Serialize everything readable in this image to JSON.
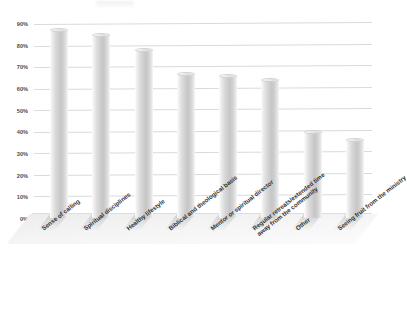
{
  "chart_data": {
    "type": "bar",
    "title": "",
    "subtitle": "",
    "xlabel": "",
    "ylabel": "",
    "ylim": [
      0,
      90
    ],
    "grid": true,
    "legend": false,
    "style": "3d-cylinder",
    "value_suffix": "%",
    "categories": [
      "Sense of calling",
      "Spiritual disciplines",
      "Healthy lifestyle",
      "Biblical and theological basis",
      "Mentor or spiritual director",
      "Regular retreats/extended time away from the community",
      "Other",
      "Seeing fruit from the ministry"
    ],
    "category_lines": [
      [
        "Sense of calling"
      ],
      [
        "Spiritual disciplines"
      ],
      [
        "Healthy lifestyle"
      ],
      [
        "Biblical and theological basis"
      ],
      [
        "Mentor or spiritual director"
      ],
      [
        "Regular retreats/extended time",
        "away from the community"
      ],
      [
        "Other"
      ],
      [
        "Seeing fruit from the ministry"
      ]
    ],
    "values": [
      87,
      85,
      78,
      67,
      66,
      64,
      40,
      36
    ],
    "ytick_labels": [
      "90%",
      "80%",
      "70%",
      "60%",
      "50%",
      "40%",
      "30%",
      "20%",
      "10%",
      "0%"
    ],
    "ytick_values": [
      90,
      80,
      70,
      60,
      50,
      40,
      30,
      20,
      10,
      0
    ],
    "colors": {
      "bar_fill_light": "#f2f2f2",
      "bar_fill_mid": "#cfcfcf",
      "bar_fill_dark": "#c6c6c6",
      "gridline": "#d8dadd",
      "tick_text": "#4d4d4d",
      "category_text": "#333333",
      "background": "#ffffff",
      "floor": "#f0f0f0"
    }
  }
}
